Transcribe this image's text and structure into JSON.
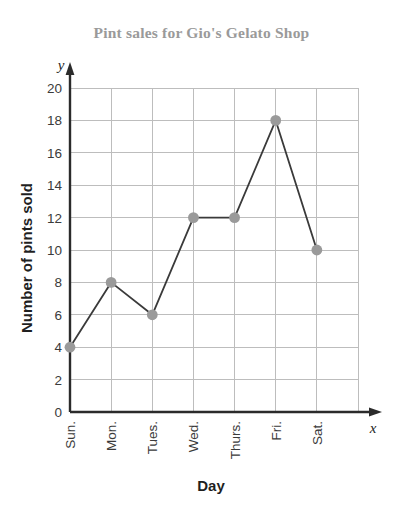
{
  "chart_data": {
    "type": "line",
    "title": "Pint sales for Gio's Gelato Shop",
    "xlabel": "Day",
    "ylabel": "Number of pints sold",
    "x_axis_variable": "x",
    "y_axis_variable": "y",
    "categories": [
      "Sun.",
      "Mon.",
      "Tues.",
      "Wed.",
      "Thurs.",
      "Fri.",
      "Sat."
    ],
    "values": [
      4,
      8,
      6,
      12,
      12,
      18,
      10
    ],
    "series": [
      {
        "name": "Pints sold",
        "values": [
          4,
          8,
          6,
          12,
          12,
          18,
          10
        ]
      }
    ],
    "ylim": [
      0,
      20
    ],
    "ytick_step": 2,
    "yticks": [
      0,
      2,
      4,
      6,
      8,
      10,
      12,
      14,
      16,
      18,
      20
    ],
    "ytick_labels": [
      "0",
      "2",
      "4",
      "6",
      "8",
      "10",
      "12",
      "14",
      "16",
      "18",
      "20"
    ],
    "grid": true,
    "grid_color": "#bdbdbd",
    "legend": "none",
    "marker": "circle",
    "line_color": "#3a3a3a",
    "marker_color": "#9a9a9a",
    "title_color": "#9a9a9a",
    "axis_color": "#2b2b2b",
    "x_tick_label_rotation": -90
  }
}
